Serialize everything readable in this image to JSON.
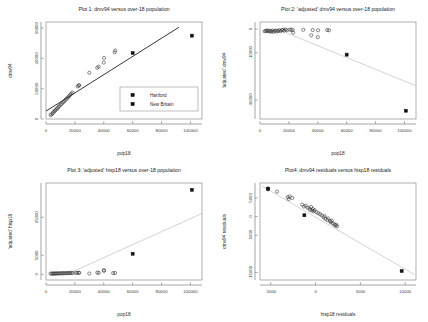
{
  "figure": {
    "background": "#ffffff",
    "panel_count": 4,
    "marker_open_label": "open-circle",
    "marker_filled_label": "filled-square"
  },
  "chart_data": [
    {
      "id": "plot1",
      "type": "scatter",
      "title": "Plot 1:   dmv94 versus over-18 population",
      "xlabel": "pop18",
      "ylabel": "dmv94",
      "xlim": [
        0,
        108000
      ],
      "ylim": [
        0,
        64000
      ],
      "xticks": [
        0,
        20000,
        40000,
        60000,
        80000,
        100000
      ],
      "xticklabels": [
        "0",
        "20000",
        "40000",
        "60000",
        "80000",
        "100000"
      ],
      "yticks": [
        0,
        20000,
        40000,
        60000
      ],
      "yticklabels": [
        "0",
        "20000",
        "40000",
        "60000"
      ],
      "grid": false,
      "fit_line": {
        "x": [
          0,
          92000
        ],
        "y": [
          5200,
          60500
        ],
        "color": "#111111"
      },
      "legend": {
        "position": "lower-right",
        "entries": [
          {
            "label": "Hartford",
            "marker": "filled-square"
          },
          {
            "label": "New Britain",
            "marker": "filled-square"
          }
        ]
      },
      "series": [
        {
          "name": "towns",
          "marker": "open-circle",
          "points": [
            [
              3200,
              2600
            ],
            [
              3900,
              3100
            ],
            [
              4600,
              3800
            ],
            [
              5200,
              4600
            ],
            [
              5900,
              5200
            ],
            [
              6500,
              5800
            ],
            [
              7200,
              6400
            ],
            [
              7900,
              7100
            ],
            [
              8600,
              7900
            ],
            [
              9300,
              8600
            ],
            [
              10200,
              9400
            ],
            [
              11000,
              10200
            ],
            [
              11800,
              11000
            ],
            [
              12600,
              11700
            ],
            [
              13500,
              12600
            ],
            [
              14300,
              13400
            ],
            [
              15200,
              14200
            ],
            [
              16000,
              15100
            ],
            [
              16800,
              16000
            ],
            [
              17600,
              16800
            ],
            [
              18400,
              17400
            ],
            [
              22000,
              21500
            ],
            [
              22600,
              22100
            ],
            [
              23000,
              22300
            ],
            [
              30000,
              30500
            ],
            [
              35500,
              33800
            ],
            [
              36500,
              34500
            ],
            [
              40000,
              37200
            ],
            [
              40200,
              40300
            ],
            [
              47500,
              44000
            ],
            [
              48000,
              45200
            ]
          ]
        },
        {
          "name": "highlighted-cities",
          "marker": "filled-square",
          "points": [
            [
              60000,
              43500
            ],
            [
              101000,
              55000
            ]
          ],
          "labels": [
            "New Britain",
            "Hartford"
          ]
        }
      ]
    },
    {
      "id": "plot2",
      "type": "scatter",
      "title": "Plot 2:   'adjusted' dmv94 versus over-18 population",
      "xlabel": "pop18",
      "ylabel": "'adjusted' dmv94",
      "xlim": [
        0,
        108000
      ],
      "ylim": [
        -38000,
        3000
      ],
      "xticks": [
        0,
        20000,
        40000,
        60000,
        80000,
        100000
      ],
      "xticklabels": [
        "0",
        "20000",
        "40000",
        "60000",
        "80000",
        "100000"
      ],
      "yticks": [
        0,
        -10000,
        -30000
      ],
      "yticklabels": [
        "0",
        "-10000",
        "-30000"
      ],
      "grid": false,
      "fit_line": {
        "x": [
          18000,
          108000
        ],
        "y": [
          -1500,
          -24000
        ],
        "color": "#c8c8c8"
      },
      "series": [
        {
          "name": "towns",
          "marker": "open-circle",
          "points": [
            [
              3200,
              -900
            ],
            [
              3900,
              -800
            ],
            [
              4600,
              -700
            ],
            [
              5200,
              -600
            ],
            [
              5900,
              -900
            ],
            [
              6500,
              -700
            ],
            [
              7200,
              -1100
            ],
            [
              7900,
              -900
            ],
            [
              8600,
              -600
            ],
            [
              9300,
              -1200
            ],
            [
              10200,
              -800
            ],
            [
              11000,
              -600
            ],
            [
              11800,
              -1000
            ],
            [
              12600,
              -700
            ],
            [
              13500,
              -500
            ],
            [
              14300,
              -900
            ],
            [
              15200,
              -400
            ],
            [
              16000,
              -300
            ],
            [
              16800,
              -700
            ],
            [
              17600,
              -200
            ],
            [
              18400,
              -500
            ],
            [
              20500,
              -300
            ],
            [
              21500,
              -200
            ],
            [
              22600,
              -400
            ],
            [
              23000,
              -1500
            ],
            [
              30000,
              -300
            ],
            [
              35500,
              -2600
            ],
            [
              36500,
              -400
            ],
            [
              40000,
              -3400
            ],
            [
              40200,
              -500
            ],
            [
              46500,
              -400
            ],
            [
              47800,
              -500
            ]
          ]
        },
        {
          "name": "highlighted-cities",
          "marker": "filled-square",
          "points": [
            [
              60000,
              -10800
            ],
            [
              101000,
              -34500
            ]
          ],
          "labels": [
            "New Britain",
            "Hartford"
          ]
        }
      ]
    },
    {
      "id": "plot3",
      "type": "scatter",
      "title": "Plot 3:   'adjusted' hisp18 versus over-18 population",
      "xlabel": "pop18",
      "ylabel": "'adjusted' hisp18",
      "xlim": [
        0,
        108000
      ],
      "ylim": [
        -1500,
        24000
      ],
      "xticks": [
        0,
        20000,
        40000,
        60000,
        80000,
        100000
      ],
      "xticklabels": [
        "0",
        "20000",
        "40000",
        "60000",
        "80000",
        "100000"
      ],
      "yticks": [
        0,
        5000,
        15000
      ],
      "yticklabels": [
        "0",
        "5000",
        "15000"
      ],
      "grid": false,
      "fit_line": {
        "x": [
          18000,
          108000
        ],
        "y": [
          600,
          16000
        ],
        "color": "#c8c8c8"
      },
      "series": [
        {
          "name": "towns",
          "marker": "open-circle",
          "points": [
            [
              3200,
              180
            ],
            [
              3900,
              200
            ],
            [
              4600,
              150
            ],
            [
              5200,
              220
            ],
            [
              5900,
              170
            ],
            [
              6500,
              240
            ],
            [
              7200,
              190
            ],
            [
              7900,
              260
            ],
            [
              8600,
              210
            ],
            [
              9300,
              280
            ],
            [
              10200,
              230
            ],
            [
              11000,
              300
            ],
            [
              11800,
              250
            ],
            [
              12600,
              320
            ],
            [
              13500,
              270
            ],
            [
              14300,
              340
            ],
            [
              15200,
              290
            ],
            [
              16000,
              360
            ],
            [
              16800,
              310
            ],
            [
              17600,
              380
            ],
            [
              18400,
              330
            ],
            [
              20500,
              400
            ],
            [
              21500,
              350
            ],
            [
              22600,
              420
            ],
            [
              23000,
              380
            ],
            [
              30000,
              200
            ],
            [
              35500,
              450
            ],
            [
              36500,
              380
            ],
            [
              40000,
              1100
            ],
            [
              40200,
              900
            ],
            [
              46500,
              300
            ],
            [
              47800,
              350
            ]
          ]
        },
        {
          "name": "highlighted-cities",
          "marker": "filled-square",
          "points": [
            [
              60000,
              5400
            ],
            [
              101000,
              22200
            ]
          ],
          "labels": [
            "New Britain",
            "Hartford"
          ]
        }
      ]
    },
    {
      "id": "plot4",
      "type": "scatter",
      "title": "Plot4:   dmv94 residuals versus hisp18 residuals",
      "xlabel": "hisp18 residuals",
      "ylabel": "dmv94 residuals",
      "xlim": [
        -6200,
        11200
      ],
      "ylim": [
        -17000,
        9000
      ],
      "xticks": [
        -5000,
        0,
        5000,
        10000
      ],
      "xticklabels": [
        "-5000",
        "0",
        "5000",
        "10000"
      ],
      "yticks": [
        5000,
        0,
        -5000,
        -15000
      ],
      "yticklabels": [
        "5000",
        "0",
        "-5000",
        "-15000"
      ],
      "grid": false,
      "fit_line": {
        "x": [
          -6000,
          11000
        ],
        "y": [
          8200,
          -15500
        ],
        "color": "#c8c8c8"
      },
      "series": [
        {
          "name": "towns",
          "marker": "open-circle",
          "points": [
            [
              -5300,
              7600
            ],
            [
              -5300,
              7300
            ],
            [
              -4300,
              6700
            ],
            [
              -3100,
              5200
            ],
            [
              -3000,
              4700
            ],
            [
              -2900,
              5400
            ],
            [
              -2600,
              5000
            ],
            [
              -1500,
              3200
            ],
            [
              -1300,
              2700
            ],
            [
              -1100,
              2900
            ],
            [
              -900,
              2400
            ],
            [
              -700,
              2200
            ],
            [
              -600,
              1800
            ],
            [
              -500,
              2600
            ],
            [
              -400,
              1600
            ],
            [
              -300,
              2000
            ],
            [
              -200,
              1400
            ],
            [
              -100,
              1700
            ],
            [
              100,
              1200
            ],
            [
              300,
              900
            ],
            [
              500,
              600
            ],
            [
              700,
              300
            ],
            [
              900,
              -200
            ],
            [
              1000,
              100
            ],
            [
              1100,
              -600
            ],
            [
              1300,
              -900
            ],
            [
              1400,
              -500
            ],
            [
              1600,
              -1200
            ],
            [
              1700,
              -1500
            ],
            [
              1800,
              -1100
            ],
            [
              1900,
              -1800
            ],
            [
              2100,
              -2100
            ],
            [
              2200,
              -2400
            ],
            [
              2300,
              -2200
            ],
            [
              2400,
              -2600
            ]
          ]
        },
        {
          "name": "highlighted-cities",
          "marker": "filled-square",
          "points": [
            [
              -1250,
              350
            ],
            [
              9600,
              -14600
            ],
            [
              -5300,
              7450
            ]
          ],
          "labels": [
            "New Britain",
            "Hartford",
            "Hartford"
          ]
        }
      ]
    }
  ]
}
